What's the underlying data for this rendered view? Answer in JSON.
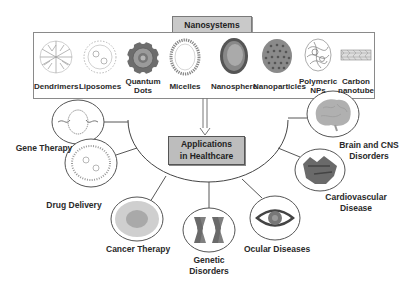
{
  "title": "Nanosystems",
  "nanosystems": [
    {
      "label": "Dendrimers",
      "icon": "dendrimer-icon"
    },
    {
      "label": "Liposomes",
      "icon": "liposome-icon"
    },
    {
      "label": "Quantum\nDots",
      "line1": "Quantum",
      "line2": "Dots",
      "icon": "quantum-dot-icon"
    },
    {
      "label": "Micelles",
      "icon": "micelle-icon"
    },
    {
      "label": "Nanosphere",
      "icon": "nanosphere-icon"
    },
    {
      "label": "Nanoparticles",
      "icon": "nanoparticle-icon"
    },
    {
      "label": "Polymeric NPs",
      "line1": "Polymeric",
      "line2": "NPs",
      "icon": "polymeric-np-icon"
    },
    {
      "label": "Carbon nanotube",
      "line1": "Carbon",
      "line2": "nanotube",
      "icon": "carbon-nanotube-icon"
    }
  ],
  "center": {
    "line1": "Applications",
    "line2": "in Healthcare"
  },
  "applications": [
    {
      "label": "Gene Therapy",
      "icon": "dna-icon"
    },
    {
      "label": "Drug Delivery",
      "icon": "drug-carrier-icon"
    },
    {
      "label": "Cancer Therapy",
      "icon": "cancer-cell-icon"
    },
    {
      "label": "Genetic Disorders",
      "line1": "Genetic",
      "line2": "Disorders",
      "icon": "chromosome-icon"
    },
    {
      "label": "Ocular Diseases",
      "icon": "eye-icon"
    },
    {
      "label": "Cardiovascular Disease",
      "line1": "Cardiovascular",
      "line2": "Disease",
      "icon": "heart-icon"
    },
    {
      "label": "Brain and CNS Disorders",
      "line1": "Brain and CNS",
      "line2": "Disorders",
      "icon": "brain-icon"
    }
  ],
  "colors": {
    "box_fill": "#c9c9c9",
    "center_fill": "#bdbdbd",
    "line": "#555555"
  }
}
